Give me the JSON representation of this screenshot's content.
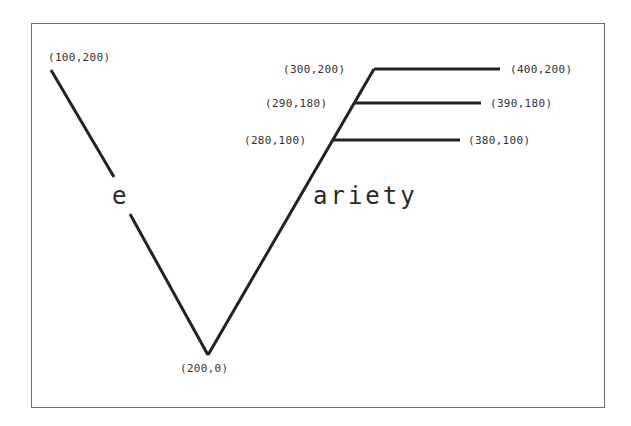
{
  "diagram": {
    "letter_left": "e",
    "word_right": "ariety",
    "line_color": "#222222",
    "frame_color": "#6b6b6b",
    "labels": {
      "p100_200": "(100,200)",
      "p200_0": "(200,0)",
      "p300_200": "(300,200)",
      "p290_180": "(290,180)",
      "p280_100": "(280,100)",
      "p400_200": "(400,200)",
      "p390_180": "(390,180)",
      "p380_100": "(380,100)"
    }
  }
}
